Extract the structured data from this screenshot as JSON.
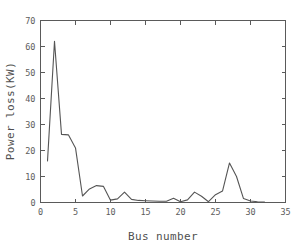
{
  "chart_data": {
    "type": "line",
    "title": "",
    "subtitle": "",
    "xlabel": "Bus number",
    "ylabel": "Power loss(KW)",
    "xlim": [
      0,
      35
    ],
    "ylim": [
      0,
      70
    ],
    "xticks": [
      0,
      5,
      10,
      15,
      20,
      25,
      30,
      35
    ],
    "yticks": [
      0,
      10,
      20,
      30,
      40,
      50,
      60,
      70
    ],
    "xtick_labels": [
      "0",
      "5",
      "10",
      "15",
      "20",
      "25",
      "30",
      "35"
    ],
    "ytick_labels": [
      "0",
      "10",
      "20",
      "30",
      "40",
      "50",
      "60",
      "70"
    ],
    "grid": false,
    "legend": null,
    "legend_position": "none",
    "line_color": "#555555",
    "series": [
      {
        "name": "Power loss",
        "x": [
          1,
          2,
          3,
          4,
          5,
          6,
          7,
          8,
          9,
          10,
          11,
          12,
          13,
          14,
          15,
          16,
          17,
          18,
          19,
          20,
          21,
          22,
          23,
          24,
          25,
          26,
          27,
          28,
          29,
          30,
          31,
          32
        ],
        "values": [
          16.0,
          62.0,
          26.2,
          26.0,
          21.0,
          2.5,
          5.2,
          6.5,
          6.2,
          0.9,
          1.4,
          4.0,
          1.2,
          0.8,
          0.7,
          0.6,
          0.5,
          0.5,
          1.6,
          0.3,
          1.0,
          4.0,
          2.4,
          0.3,
          3.0,
          4.4,
          15.2,
          10.0,
          1.5,
          0.6,
          0.3,
          0.2
        ]
      }
    ]
  },
  "axes": {
    "x_axis_name": "Bus number",
    "y_axis_name": "Power loss(KW)"
  }
}
